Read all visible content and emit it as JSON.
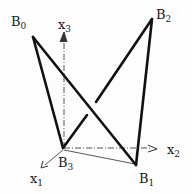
{
  "diagram": {
    "type": "3D tetrahedron-like wireframe with coordinate axes",
    "vertices": [
      {
        "id": "B0",
        "label": "B",
        "sub": "0",
        "x": 33,
        "y": 37
      },
      {
        "id": "B1",
        "label": "B",
        "sub": "1",
        "x": 136,
        "y": 165
      },
      {
        "id": "B2",
        "label": "B",
        "sub": "2",
        "x": 152,
        "y": 19
      },
      {
        "id": "B3",
        "label": "B",
        "sub": "3",
        "x": 63,
        "y": 148
      }
    ],
    "edges": [
      {
        "from": "B0",
        "to": "B3",
        "style": "thick"
      },
      {
        "from": "B0",
        "to": "B1",
        "style": "thick"
      },
      {
        "from": "B2",
        "to": "B3",
        "style": "thick-broken"
      },
      {
        "from": "B2",
        "to": "B1",
        "style": "thick"
      },
      {
        "from": "B3",
        "to": "B1",
        "style": "thin"
      }
    ],
    "axes": [
      {
        "id": "x1",
        "label": "x",
        "sub": "1",
        "direction": "lower-left"
      },
      {
        "id": "x2",
        "label": "x",
        "sub": "2",
        "direction": "right"
      },
      {
        "id": "x3",
        "label": "x",
        "sub": "3",
        "direction": "up"
      }
    ],
    "colors": {
      "line": "#111111",
      "axis": "#555555",
      "background": "#fdfdfd"
    }
  }
}
